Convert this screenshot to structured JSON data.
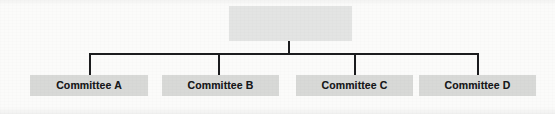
{
  "diagram": {
    "type": "org-chart",
    "canvas": {
      "width": 555,
      "height": 114
    },
    "background_color": "#fbfbfa",
    "line_color": "#1b1c1e",
    "root": {
      "label": "",
      "fill_color": "#e3e4e3",
      "box": {
        "x": 229,
        "y": 6,
        "width": 123,
        "height": 35
      }
    },
    "children": [
      {
        "label": "Committee A",
        "fill_color": "#d8d9d7",
        "box": {
          "x": 30,
          "y": 75,
          "width": 118,
          "height": 21
        },
        "connector_x": 89
      },
      {
        "label": "Committee B",
        "fill_color": "#d8d9d7",
        "box": {
          "x": 162,
          "y": 75,
          "width": 117,
          "height": 21
        },
        "connector_x": 218
      },
      {
        "label": "Committee C",
        "fill_color": "#d8d9d7",
        "box": {
          "x": 296,
          "y": 75,
          "width": 117,
          "height": 21
        },
        "connector_x": 354
      },
      {
        "label": "Committee D",
        "fill_color": "#d8d9d7",
        "box": {
          "x": 419,
          "y": 75,
          "width": 117,
          "height": 21
        },
        "connector_x": 477
      }
    ],
    "connectors": {
      "root_stem": {
        "x": 288,
        "y_top": 40,
        "y_bottom": 54
      },
      "bus": {
        "x_left": 89,
        "x_right": 478,
        "y": 53
      },
      "drop_y_top": 53,
      "drop_y_bottom": 75
    }
  }
}
